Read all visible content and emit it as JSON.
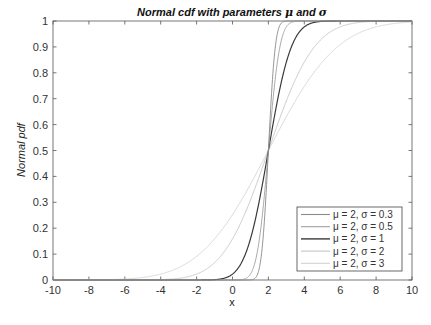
{
  "chart_data": {
    "type": "line",
    "title": "Normal cdf with parameters μ and σ",
    "title_parts": {
      "prefix": "Normal cdf with parameters ",
      "mu": "μ",
      "mid": " and ",
      "sigma": "σ"
    },
    "xlabel": "x",
    "ylabel": "Normal pdf",
    "xlim": [
      -10,
      10
    ],
    "ylim": [
      0,
      1
    ],
    "xticks": [
      -10,
      -8,
      -6,
      -4,
      -2,
      0,
      2,
      4,
      6,
      8,
      10
    ],
    "yticks": [
      0,
      0.1,
      0.2,
      0.3,
      0.4,
      0.5,
      0.6,
      0.7,
      0.8,
      0.9,
      1
    ],
    "ytick_labels": [
      "0",
      "0.1",
      "0.2",
      "0.3",
      "0.4",
      "0.5",
      "0.6",
      "0.7",
      "0.8",
      "0.9",
      "1"
    ],
    "grid": false,
    "legend_position": "southeast",
    "series": [
      {
        "name": "μ = 2, σ = 0.3",
        "mu": 2,
        "sigma": 0.3,
        "color": "#8a8a8a",
        "width": 0.9
      },
      {
        "name": "μ = 2, σ = 0.5",
        "mu": 2,
        "sigma": 0.5,
        "color": "#a0a0a0",
        "width": 0.9
      },
      {
        "name": "μ = 2, σ = 1",
        "mu": 2,
        "sigma": 1,
        "color": "#3a3a3a",
        "width": 1.2
      },
      {
        "name": "μ = 2, σ = 2",
        "mu": 2,
        "sigma": 2,
        "color": "#c4c4c4",
        "width": 0.9
      },
      {
        "name": "μ = 2, σ = 3",
        "mu": 2,
        "sigma": 3,
        "color": "#d2d2d2",
        "width": 0.9
      }
    ]
  }
}
